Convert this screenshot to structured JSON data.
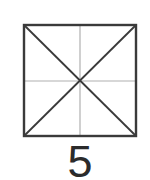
{
  "figure": {
    "square": {
      "x1": 24,
      "y1": 25,
      "x2": 136,
      "y2": 136
    },
    "stroke_color": "#3a3a3a",
    "guide_color": "#b0b0b0",
    "label": "5"
  }
}
